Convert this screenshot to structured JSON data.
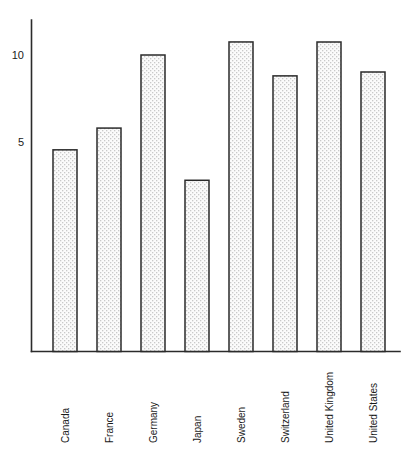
{
  "chart_data": {
    "type": "bar",
    "title": "",
    "subtitle": "",
    "xlabel": "",
    "ylabel": "",
    "categories": [
      "Canada",
      "France",
      "Germany",
      "Japan",
      "Sweden",
      "Switzerland",
      "United Kingdom",
      "United States"
    ],
    "values": [
      10.3,
      9.85,
      4.55,
      5.8,
      10.0,
      2.8,
      10.75,
      8.8
    ],
    "ytick_labels": [
      "10",
      "5"
    ],
    "ytick_values": [
      10,
      5
    ],
    "ylim": [
      0,
      11.6
    ],
    "grid": false,
    "legend": null,
    "bar_fill": "#f2f2f2",
    "bar_pattern": "stipple-dots",
    "bar_edge_color": "#2b2b2b",
    "axis_color": "#2b2b2b",
    "text_color": "#1a1a1a",
    "background": "#ffffff",
    "category_label_rotation": -90
  },
  "axes": {
    "y_axis_name": "value-axis",
    "x_axis_name": "category-axis"
  }
}
